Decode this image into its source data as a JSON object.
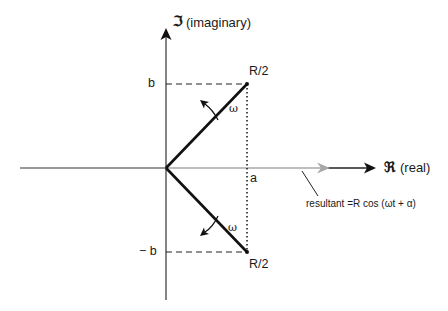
{
  "diagram": {
    "axes": {
      "imaginary": {
        "symbol": "ℑ",
        "label": "(imaginary)"
      },
      "real": {
        "symbol": "ℜ",
        "label": "(real)"
      }
    },
    "ticks": {
      "b": "b",
      "neg_b": "− b",
      "a": "a"
    },
    "phasors": [
      {
        "name": "upper",
        "label": "R/2",
        "rotation_label": "ω",
        "rotation": "counter-clockwise"
      },
      {
        "name": "lower",
        "label": "R/2",
        "rotation_label": "ω",
        "rotation": "clockwise"
      }
    ],
    "resultant": {
      "annotation": "resultant =R cos (ωt + α)"
    },
    "colors": {
      "ink": "#1a1a1a",
      "phasor": "#111111",
      "resultant": "#a8a8a8",
      "axis": "#333333"
    }
  }
}
